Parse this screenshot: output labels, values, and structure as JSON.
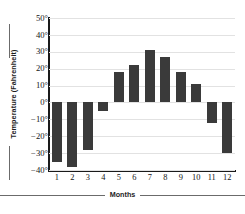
{
  "chart_data": {
    "type": "bar",
    "title": "",
    "xlabel": "Months",
    "ylabel": "Temperature (Fahrenheit)",
    "categories": [
      "1",
      "2",
      "3",
      "4",
      "5",
      "6",
      "7",
      "8",
      "9",
      "10",
      "11",
      "12"
    ],
    "values": [
      -35,
      -38,
      -28,
      -5,
      18,
      22,
      31,
      27,
      18,
      11,
      -12,
      -30
    ],
    "ylim": [
      -40,
      50
    ],
    "yticks": [
      50,
      40,
      30,
      20,
      10,
      0,
      -10,
      -20,
      -30,
      -40
    ],
    "ytick_labels": [
      "50°",
      "40°",
      "30°",
      "20°",
      "10°",
      "0°",
      "−10°",
      "−20°",
      "−30°",
      "−40°"
    ],
    "grid": true,
    "legend": "none",
    "bar_color": "#3a3a3a",
    "grid_color": "#e2e2e2",
    "axis_color": "#1a1a1a"
  }
}
